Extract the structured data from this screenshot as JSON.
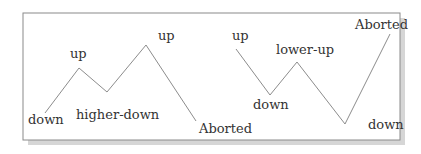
{
  "diagram": {
    "frame": {
      "x": 23,
      "y": 13,
      "width": 377,
      "height": 127,
      "border_color": "#8a8a8a",
      "shadow_color": "#d6d6d6"
    },
    "line_color": "#8c8c8c",
    "left_pattern": {
      "points": "45,113 79,68 107,92 146,45 196,121",
      "labels": [
        {
          "text": "down",
          "x": 28,
          "y": 124
        },
        {
          "text": "up",
          "x": 70,
          "y": 58
        },
        {
          "text": "higher-down",
          "x": 76,
          "y": 119
        },
        {
          "text": "up",
          "x": 158,
          "y": 40
        },
        {
          "text": "Aborted",
          "x": 199,
          "y": 133
        }
      ]
    },
    "right_pattern": {
      "points": "236,49 270,95 297,62 345,124 390,34",
      "labels": [
        {
          "text": "up",
          "x": 232,
          "y": 40
        },
        {
          "text": "down",
          "x": 253,
          "y": 109
        },
        {
          "text": "lower-up",
          "x": 276,
          "y": 54
        },
        {
          "text": "down",
          "x": 368,
          "y": 129
        },
        {
          "text": "Aborted",
          "x": 355,
          "y": 29
        }
      ]
    }
  }
}
